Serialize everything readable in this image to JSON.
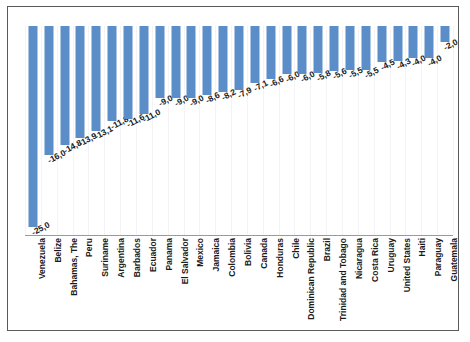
{
  "chart_data": {
    "type": "bar",
    "title": "",
    "subtitle": "",
    "xlabel": "",
    "ylabel": "",
    "ylim": [
      -26,
      0
    ],
    "grid": true,
    "legend": false,
    "orientation": "vertical",
    "decimal_separator": ",",
    "bar_color": "#5b8dc8",
    "categories": [
      "Venezuela",
      "Belize",
      "Bahamas, The",
      "Peru",
      "Suriname",
      "Argentina",
      "Barbados",
      "Ecuador",
      "Panama",
      "El Salvador",
      "Mexico",
      "Jamaica",
      "Colombia",
      "Bolivia",
      "Canada",
      "Honduras",
      "Chile",
      "Dominican Republic",
      "Brazil",
      "Trinidad and Tobago",
      "Nicaragua",
      "Costa Rica",
      "Uruguay",
      "United States",
      "Haiti",
      "Paraguay",
      "Guatemala"
    ],
    "values": [
      -25.0,
      -16.0,
      -14.8,
      -13.9,
      -13.1,
      -11.8,
      -11.6,
      -11.0,
      -9.0,
      -9.0,
      -9.0,
      -8.6,
      -8.2,
      -7.9,
      -7.1,
      -6.6,
      -6.0,
      -6.0,
      -5.8,
      -5.6,
      -5.5,
      -5.5,
      -4.5,
      -4.3,
      -4.0,
      -4.0,
      -2.0
    ],
    "value_labels": [
      "-25,0",
      "-16,0",
      "-14,8",
      "-13,9",
      "-13,1",
      "-11,8",
      "-11,6",
      "-11,0",
      "-9,0",
      "-9,0",
      "-9,0",
      "-8,6",
      "-8,2",
      "-7,9",
      "-7,1",
      "-6,6",
      "-6,0",
      "-6,0",
      "-5,8",
      "-5,6",
      "-5,5",
      "-5,5",
      "-4,5",
      "-4,3",
      "-4,0",
      "-4,0",
      "-2,0"
    ]
  }
}
